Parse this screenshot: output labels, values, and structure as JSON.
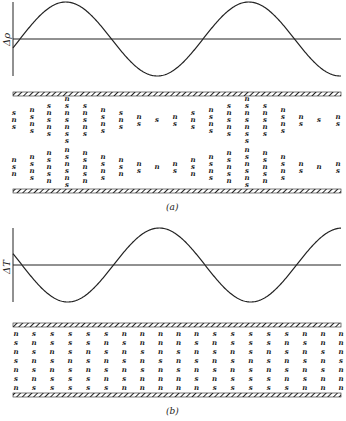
{
  "figure": {
    "panels": [
      {
        "id": "a",
        "caption": "(a)",
        "ylabel": "Δρ",
        "wave": {
          "phase_note": "density perturbation",
          "start_sign": "negative",
          "cycles": 2
        },
        "columns": [
          {
            "x": 14,
            "upper": [
              "s",
              "n",
              "s"
            ],
            "lower": [
              "n",
              "s",
              "n"
            ]
          },
          {
            "x": 32,
            "upper": [
              "n",
              "s",
              "n",
              "s"
            ],
            "lower": [
              "n",
              "s",
              "n",
              "s"
            ]
          },
          {
            "x": 49,
            "upper": [
              "s",
              "n",
              "s",
              "n",
              "s"
            ],
            "lower": [
              "n",
              "s",
              "n",
              "s",
              "n"
            ]
          },
          {
            "x": 67,
            "upper": [
              "n",
              "s",
              "n",
              "s",
              "n",
              "s",
              "s"
            ],
            "lower": [
              "n",
              "s",
              "n",
              "s",
              "n",
              "s"
            ]
          },
          {
            "x": 85,
            "upper": [
              "s",
              "n",
              "s",
              "n",
              "s"
            ],
            "lower": [
              "n",
              "s",
              "n",
              "s",
              "n"
            ]
          },
          {
            "x": 103,
            "upper": [
              "n",
              "s",
              "n",
              "s"
            ],
            "lower": [
              "n",
              "s",
              "n",
              "s"
            ]
          },
          {
            "x": 121,
            "upper": [
              "s",
              "n",
              "s"
            ],
            "lower": [
              "n",
              "s",
              "n"
            ]
          },
          {
            "x": 139,
            "upper": [
              "n",
              "s"
            ],
            "lower": [
              "n",
              "s"
            ]
          },
          {
            "x": 157,
            "upper": [
              "s"
            ],
            "lower": [
              "n"
            ]
          },
          {
            "x": 175,
            "upper": [
              "n",
              "s"
            ],
            "lower": [
              "n",
              "s"
            ]
          },
          {
            "x": 193,
            "upper": [
              "s",
              "n",
              "s"
            ],
            "lower": [
              "n",
              "s",
              "n"
            ]
          },
          {
            "x": 211,
            "upper": [
              "n",
              "s",
              "n",
              "s"
            ],
            "lower": [
              "n",
              "s",
              "n",
              "s"
            ]
          },
          {
            "x": 229,
            "upper": [
              "s",
              "n",
              "s",
              "n",
              "s"
            ],
            "lower": [
              "n",
              "s",
              "n",
              "s",
              "n"
            ]
          },
          {
            "x": 247,
            "upper": [
              "n",
              "s",
              "n",
              "s",
              "n",
              "s",
              "s"
            ],
            "lower": [
              "n",
              "s",
              "n",
              "s",
              "n",
              "s"
            ]
          },
          {
            "x": 265,
            "upper": [
              "s",
              "n",
              "s",
              "n",
              "s"
            ],
            "lower": [
              "n",
              "s",
              "n",
              "s",
              "n"
            ]
          },
          {
            "x": 283,
            "upper": [
              "n",
              "s",
              "n",
              "s"
            ],
            "lower": [
              "n",
              "s",
              "n",
              "s"
            ]
          },
          {
            "x": 301,
            "upper": [
              "n",
              "s"
            ],
            "lower": [
              "n",
              "s"
            ]
          },
          {
            "x": 319,
            "upper": [
              "s"
            ],
            "lower": [
              "n"
            ]
          },
          {
            "x": 338,
            "upper": [
              "n",
              "s"
            ],
            "lower": [
              "n",
              "s"
            ]
          }
        ]
      },
      {
        "id": "b",
        "caption": "(b)",
        "ylabel": "ΔT",
        "wave": {
          "phase_note": "temperature perturbation",
          "start_sign": "positive",
          "cycles": 2
        },
        "columns": [
          [
            "n",
            "s",
            "n",
            "s",
            "n",
            "s",
            "n"
          ],
          [
            "s",
            "n",
            "s",
            "n",
            "s",
            "n",
            "s"
          ],
          [
            "s",
            "s",
            "n",
            "s",
            "n",
            "s",
            "s"
          ],
          [
            "s",
            "s",
            "s",
            "n",
            "s",
            "s",
            "s"
          ],
          [
            "s",
            "s",
            "n",
            "s",
            "n",
            "s",
            "s"
          ],
          [
            "s",
            "n",
            "s",
            "n",
            "s",
            "n",
            "s"
          ],
          [
            "n",
            "s",
            "n",
            "s",
            "n",
            "s",
            "n"
          ],
          [
            "n",
            "n",
            "s",
            "n",
            "s",
            "n",
            "n"
          ],
          [
            "n",
            "n",
            "n",
            "s",
            "n",
            "n",
            "n"
          ],
          [
            "n",
            "n",
            "s",
            "n",
            "s",
            "n",
            "n"
          ],
          [
            "n",
            "s",
            "n",
            "s",
            "n",
            "s",
            "n"
          ],
          [
            "s",
            "n",
            "s",
            "n",
            "s",
            "n",
            "s"
          ],
          [
            "s",
            "s",
            "n",
            "s",
            "n",
            "s",
            "s"
          ],
          [
            "s",
            "s",
            "s",
            "n",
            "s",
            "s",
            "s"
          ],
          [
            "s",
            "s",
            "n",
            "s",
            "n",
            "s",
            "s"
          ],
          [
            "s",
            "n",
            "s",
            "n",
            "s",
            "n",
            "s"
          ],
          [
            "n",
            "s",
            "n",
            "s",
            "n",
            "s",
            "n"
          ],
          [
            "n",
            "n",
            "s",
            "n",
            "s",
            "n",
            "n"
          ],
          [
            "n",
            "n",
            "n",
            "s",
            "n",
            "n",
            "n"
          ]
        ]
      }
    ]
  }
}
